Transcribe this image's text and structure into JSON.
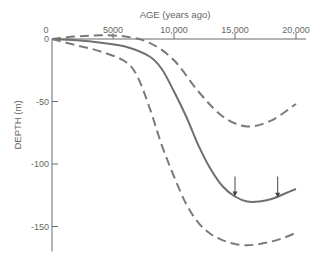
{
  "chart_data": {
    "type": "line",
    "title": "",
    "xlabel": "AGE (years ago)",
    "ylabel": "DEPTH (m)",
    "xlim": [
      0,
      20000
    ],
    "ylim": [
      -170,
      5
    ],
    "x_ticks": [
      0,
      5000,
      10000,
      15000,
      20000
    ],
    "x_tick_labels": [
      "0",
      "5000",
      "10,000",
      "15,000",
      "20,000"
    ],
    "y_ticks": [
      0,
      -50,
      -100,
      -150
    ],
    "y_tick_labels": [
      "0",
      "-50",
      "-100",
      "-150"
    ],
    "grid": false,
    "legend": null,
    "x_axis_position": "top",
    "series": [
      {
        "name": "upper bound",
        "style": "dashed",
        "color": "#7a7a7a",
        "x": [
          0,
          2000,
          4000,
          6000,
          8000,
          10000,
          12000,
          14000,
          16000,
          18000,
          20000
        ],
        "values": [
          0,
          2,
          3,
          2,
          -3,
          -17,
          -42,
          -62,
          -70,
          -65,
          -52
        ]
      },
      {
        "name": "sea level curve",
        "style": "solid",
        "color": "#6f6f6f",
        "x": [
          0,
          2000,
          4000,
          6000,
          8000,
          9000,
          10000,
          11000,
          12000,
          13000,
          14000,
          15000,
          16000,
          17000,
          18000,
          19000,
          20000
        ],
        "values": [
          0,
          -1,
          -3,
          -6,
          -14,
          -24,
          -42,
          -62,
          -85,
          -104,
          -118,
          -126,
          -130,
          -130,
          -128,
          -124,
          -120
        ]
      },
      {
        "name": "lower bound",
        "style": "dashed",
        "color": "#7a7a7a",
        "x": [
          0,
          2000,
          4000,
          6000,
          7000,
          8000,
          9000,
          10000,
          11000,
          12000,
          13000,
          14000,
          15000,
          16000,
          17000,
          18000,
          19000,
          20000
        ],
        "values": [
          0,
          -5,
          -10,
          -18,
          -30,
          -55,
          -85,
          -110,
          -132,
          -147,
          -156,
          -161,
          -164,
          -165,
          -164,
          -162,
          -159,
          -155
        ]
      }
    ],
    "annotations": [
      {
        "type": "arrow",
        "x": 15000,
        "y_from": -110,
        "y_to": -126,
        "direction": "down"
      },
      {
        "type": "arrow",
        "x": 18500,
        "y_from": -110,
        "y_to": -127,
        "direction": "down"
      }
    ]
  }
}
